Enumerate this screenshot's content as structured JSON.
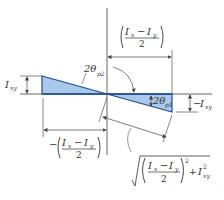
{
  "diagram": {
    "colors": {
      "fill": "#a9c8ea",
      "edge": "#1f4f96",
      "line": "#555555",
      "text": "#333333"
    },
    "labels": {
      "top_dimension": {
        "numerator_a": "I",
        "sub_a": "x",
        "minus": "−",
        "numerator_b": "I",
        "sub_b": "y",
        "denominator": "2"
      },
      "left_height": {
        "symbol": "I",
        "sub": "xy"
      },
      "right_height": {
        "sign": "−",
        "symbol": "I",
        "sub": "xy"
      },
      "angle_2": {
        "text": "2θ",
        "sub": "p2"
      },
      "angle_1": {
        "text": "2θ",
        "sub": "p1"
      },
      "bottom_dimension": {
        "sign": "−",
        "numerator_a": "I",
        "sub_a": "x",
        "minus": "−",
        "numerator_b": "I",
        "sub_b": "y",
        "denominator": "2"
      },
      "hypotenuse": {
        "numerator_a": "I",
        "sub_a": "x",
        "minus": "−",
        "numerator_b": "I",
        "sub_b": "y",
        "denominator": "2",
        "power": "2",
        "plus": "+",
        "term": "I",
        "term_sub": "xy",
        "term_power": "2"
      }
    }
  }
}
